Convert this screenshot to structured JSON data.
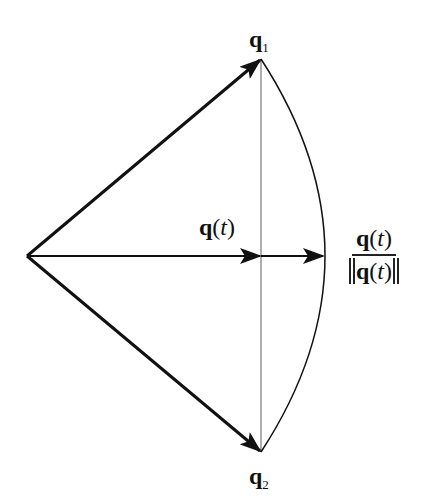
{
  "diagram": {
    "type": "vector-normalization-slerp",
    "labels": {
      "q1": {
        "base": "q",
        "sub": "1"
      },
      "q2": {
        "base": "q",
        "sub": "2"
      },
      "qt": {
        "base": "q",
        "open": "(",
        "var": "t",
        "close": ")"
      },
      "normalized": {
        "numerator": {
          "base": "q",
          "open": "(",
          "var": "t",
          "close": ")"
        },
        "denominator": {
          "base": "q",
          "open": "(",
          "var": "t",
          "close": ")"
        }
      }
    },
    "geometry": {
      "origin": [
        27,
        256
      ],
      "q1_tip": [
        261,
        59
      ],
      "q2_tip": [
        261,
        452
      ],
      "qt_tip": [
        261,
        256
      ],
      "normalized_tip": [
        324,
        256
      ],
      "chord_x": 261,
      "arc_apex_x": 325
    },
    "colors": {
      "stroke": "#111111",
      "chord": "#777777",
      "background": "#ffffff"
    }
  }
}
